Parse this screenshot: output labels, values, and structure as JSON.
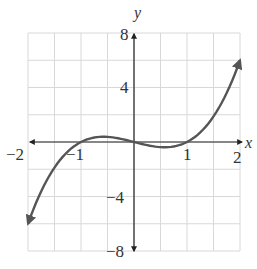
{
  "chart_data": {
    "type": "line",
    "title": "",
    "function": "y = x^3 - x",
    "xlabel": "x",
    "ylabel": "y",
    "xlim": [
      -2,
      2
    ],
    "ylim": [
      -8,
      8
    ],
    "grid": true,
    "x_grid_step": 0.5,
    "y_grid_step": 2,
    "x_tick_labels": [
      "-2",
      "-1",
      "1",
      "2"
    ],
    "x_ticks": [
      -2,
      -1,
      1,
      2
    ],
    "y_tick_labels": [
      "8",
      "4",
      "-4",
      "-8"
    ],
    "y_ticks": [
      8,
      4,
      -4,
      -8
    ],
    "series": [
      {
        "name": "f(x)",
        "x": [
          -2,
          -1.5,
          -1,
          -0.577,
          0,
          0.577,
          1,
          1.5,
          2
        ],
        "values": [
          -6,
          -1.875,
          0,
          0.385,
          0,
          -0.385,
          0,
          1.875,
          6
        ],
        "arrows_at_ends": true
      }
    ],
    "x_intercepts": [
      -1,
      0,
      1
    ],
    "colors": {
      "curve": "#555555",
      "axis": "#222222",
      "grid": "#d8d8d8",
      "text": "#333333"
    }
  },
  "labels": {
    "x_axis": "x",
    "y_axis": "y",
    "xt_m2": "−2",
    "xt_m1": "−1",
    "xt_1": "1",
    "xt_2": "2",
    "yt_8": "8",
    "yt_4": "4",
    "yt_m4": "−4",
    "yt_m8": "−8"
  }
}
